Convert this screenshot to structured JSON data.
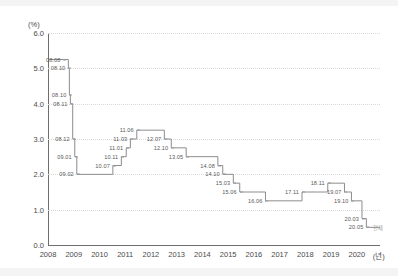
{
  "chart_data": {
    "type": "line",
    "title": "",
    "subtitle": "",
    "xlabel": "(년)",
    "ylabel": "(%)",
    "ylim": [
      0.0,
      6.0
    ],
    "xlim": [
      2008.0,
      2020.9
    ],
    "grid": true,
    "legend_position": "none",
    "y_ticks": [
      "0.0",
      "1.0",
      "2.0",
      "3.0",
      "4.0",
      "5.0",
      "6.0"
    ],
    "y_tick_values": [
      0.0,
      1.0,
      2.0,
      3.0,
      4.0,
      5.0,
      6.0
    ],
    "x_ticks": [
      "2008",
      "2009",
      "2010",
      "2011",
      "2012",
      "2013",
      "2014",
      "2015",
      "2016",
      "2017",
      "2018",
      "2019",
      "2020"
    ],
    "x_tick_values": [
      2008,
      2009,
      2010,
      2011,
      2012,
      2013,
      2014,
      2015,
      2016,
      2017,
      2018,
      2019,
      2020
    ],
    "series": [
      {
        "name": "기준금리",
        "step": "post",
        "color": "#8c8c8c",
        "points": [
          {
            "label": "08.08",
            "x": 2008.6,
            "y": 5.25
          },
          {
            "label": "08.10",
            "x": 2008.79,
            "y": 5.0
          },
          {
            "label": "08.10",
            "x": 2008.83,
            "y": 4.25
          },
          {
            "label": "08.11",
            "x": 2008.87,
            "y": 4.0
          },
          {
            "label": "08.12",
            "x": 2008.96,
            "y": 3.0
          },
          {
            "label": "09.01",
            "x": 2009.04,
            "y": 2.5
          },
          {
            "label": "09.02",
            "x": 2009.12,
            "y": 2.0
          },
          {
            "label": "10.07",
            "x": 2010.52,
            "y": 2.25
          },
          {
            "label": "10.11",
            "x": 2010.85,
            "y": 2.5
          },
          {
            "label": "11.01",
            "x": 2011.04,
            "y": 2.75
          },
          {
            "label": "11.03",
            "x": 2011.2,
            "y": 3.0
          },
          {
            "label": "11.06",
            "x": 2011.45,
            "y": 3.25
          },
          {
            "label": "12.07",
            "x": 2012.52,
            "y": 3.0
          },
          {
            "label": "12.10",
            "x": 2012.79,
            "y": 2.75
          },
          {
            "label": "13.05",
            "x": 2013.37,
            "y": 2.5
          },
          {
            "label": "14.08",
            "x": 2014.6,
            "y": 2.25
          },
          {
            "label": "14.10",
            "x": 2014.79,
            "y": 2.0
          },
          {
            "label": "15.03",
            "x": 2015.2,
            "y": 1.75
          },
          {
            "label": "15.06",
            "x": 2015.45,
            "y": 1.5
          },
          {
            "label": "16.06",
            "x": 2016.45,
            "y": 1.25
          },
          {
            "label": "17.11",
            "x": 2017.87,
            "y": 1.5
          },
          {
            "label": "18.11",
            "x": 2018.87,
            "y": 1.75
          },
          {
            "label": "19.07",
            "x": 2019.52,
            "y": 1.5
          },
          {
            "label": "19.10",
            "x": 2019.79,
            "y": 1.25
          },
          {
            "label": "20.03",
            "x": 2020.2,
            "y": 0.75
          },
          {
            "label": "20.05",
            "x": 2020.37,
            "y": 0.5
          }
        ]
      }
    ],
    "annotations": [
      {
        "name": "series-end-marker",
        "text": "현재",
        "x": 2020.62,
        "y": 0.5
      }
    ],
    "colors": {
      "line": "#8c8c8c",
      "axis": "#6e6e6e",
      "grid": "#d9d9d9",
      "tick_text": "#4a4a4a",
      "point_label": "#5a5a5a",
      "background": "#ffffff"
    }
  }
}
